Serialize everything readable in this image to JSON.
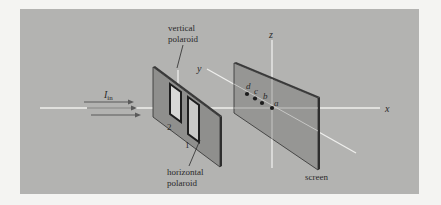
{
  "figure": {
    "background_color": "#f4f4f2",
    "panel_color": "#b3b3b1",
    "axes": {
      "x_label": "x",
      "y_label": "y",
      "z_label": "z"
    },
    "beam": {
      "label_main": "I",
      "label_sub": "in"
    },
    "polaroid_slab": {
      "window_1_label": "1",
      "window_2_label": "2",
      "vertical_label_line1": "vertical",
      "vertical_label_line2": "polaroid",
      "horizontal_label_line1": "horizontal",
      "horizontal_label_line2": "polaroid"
    },
    "screen": {
      "label": "screen",
      "points": [
        {
          "label": "a"
        },
        {
          "label": "b"
        },
        {
          "label": "c"
        },
        {
          "label": "d"
        }
      ]
    },
    "colors": {
      "slab_face": "#8f8f8d",
      "slab_edge": "#2e2e2e",
      "axis_line": "#f2f2f2",
      "arrow": "#5a5a5a",
      "dot": "#1c1c1c"
    }
  }
}
